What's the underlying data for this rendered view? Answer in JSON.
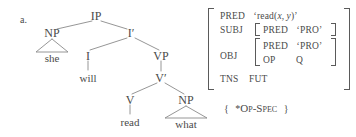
{
  "example": {
    "label": "a."
  },
  "tree": {
    "type": "syntax-tree",
    "nodes": [
      {
        "id": "IP",
        "label": "IP",
        "x": 96,
        "y": 16
      },
      {
        "id": "NP1",
        "label": "NP",
        "x": 52,
        "y": 33
      },
      {
        "id": "she",
        "label": "she",
        "x": 52,
        "y": 57
      },
      {
        "id": "Ibar",
        "label": "I′",
        "x": 131,
        "y": 33
      },
      {
        "id": "I",
        "label": "I",
        "x": 88,
        "y": 56
      },
      {
        "id": "will",
        "label": "will",
        "x": 88,
        "y": 78
      },
      {
        "id": "VP",
        "label": "VP",
        "x": 161,
        "y": 56
      },
      {
        "id": "Vbar",
        "label": "V′",
        "x": 161,
        "y": 78
      },
      {
        "id": "V",
        "label": "V",
        "x": 130,
        "y": 100
      },
      {
        "id": "read",
        "label": "read",
        "x": 130,
        "y": 122
      },
      {
        "id": "NP2",
        "label": "NP",
        "x": 186,
        "y": 100
      },
      {
        "id": "what",
        "label": "what",
        "x": 186,
        "y": 124
      }
    ],
    "triangles": [
      {
        "id": "tri-she",
        "apex_x": 52,
        "apex_y": 38,
        "base_y": 52,
        "half_width": 16
      },
      {
        "id": "tri-what",
        "apex_x": 186,
        "apex_y": 105,
        "base_y": 118,
        "half_width": 21
      }
    ]
  },
  "avm": {
    "rows": [
      {
        "attr": "PRED",
        "value": "‘read(x, y)’"
      },
      {
        "attr": "SUBJ",
        "value": ""
      },
      {
        "attr": "OBJ",
        "value": ""
      },
      {
        "attr": "TNS",
        "value": "FUT"
      }
    ],
    "subj": {
      "attr": "PRED",
      "value": "‘PRO’"
    },
    "obj": {
      "rows": [
        {
          "attr": "PRED",
          "value": "‘PRO’"
        },
        {
          "attr": "OP",
          "value": "Q"
        }
      ]
    }
  },
  "constraint": {
    "open_brace": "{",
    "star": "*",
    "text": "Op-Spec",
    "close_brace": "}"
  },
  "colors": {
    "ink": "#4a4a4a",
    "line": "#8a8a8a",
    "background": "#ffffff"
  }
}
